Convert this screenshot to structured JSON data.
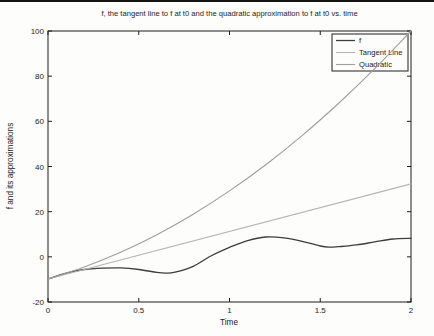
{
  "figure": {
    "background": "#fdfdfc",
    "axis_color": "#1f1f1f",
    "scan_artifact": "black strip along top edge"
  },
  "chart_data": {
    "type": "line",
    "title": "f, the tangent line to f at t0 and the quadratic approximation to f at t0 vs. time",
    "xlabel": "Time",
    "ylabel": "f and its approximations",
    "xlim": [
      0,
      2
    ],
    "ylim": [
      -20,
      100
    ],
    "xticks": [
      0,
      0.5,
      1,
      1.5,
      2
    ],
    "xtick_labels": [
      "0",
      "0.5",
      "1",
      "1.5",
      "2"
    ],
    "yticks": [
      -20,
      0,
      20,
      40,
      60,
      80,
      100
    ],
    "ytick_labels": [
      "-20",
      "0",
      "20",
      "40",
      "60",
      "80",
      "100"
    ],
    "grid": false,
    "legend_position": "upper right",
    "series": [
      {
        "name": "f",
        "color": "#3d3d3d",
        "width": 1.3,
        "x": [
          0,
          0.1,
          0.2,
          0.3,
          0.4,
          0.5,
          0.6,
          0.65,
          0.7,
          0.8,
          0.9,
          1.0,
          1.1,
          1.2,
          1.3,
          1.4,
          1.5,
          1.55,
          1.6,
          1.7,
          1.8,
          1.9,
          2.0
        ],
        "y": [
          -9.8,
          -7.2,
          -5.6,
          -5.0,
          -4.9,
          -5.6,
          -6.9,
          -7.2,
          -6.8,
          -4.2,
          0.5,
          4.2,
          7.2,
          8.8,
          8.4,
          6.9,
          4.8,
          4.3,
          4.5,
          5.3,
          6.6,
          7.9,
          8.2
        ]
      },
      {
        "name": "Tangent Line",
        "color": "#b6b6b6",
        "width": 1.1,
        "x": [
          0,
          2
        ],
        "y": [
          -9.8,
          32.3
        ]
      },
      {
        "name": "Quadratic",
        "color": "#9e9e9e",
        "width": 1.1,
        "x": [
          0,
          0.2,
          0.4,
          0.6,
          0.8,
          1.0,
          1.2,
          1.4,
          1.6,
          1.8,
          2.0
        ],
        "y": [
          -9.8,
          -4.5,
          2.0,
          9.8,
          18.9,
          29.2,
          40.8,
          53.7,
          67.9,
          83.3,
          100.0
        ]
      }
    ],
    "legend": {
      "entries": [
        "f",
        "Tangent Line",
        "Quadratic"
      ]
    }
  }
}
